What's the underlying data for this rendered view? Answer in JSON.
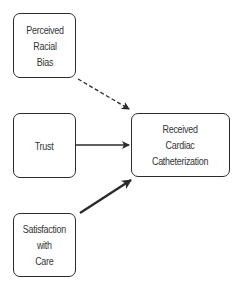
{
  "diagram": {
    "type": "path-diagram",
    "nodes": [
      {
        "id": "perceived_racial_bias",
        "label": "Perceived\nRacial\nBias"
      },
      {
        "id": "trust",
        "label": "Trust"
      },
      {
        "id": "satisfaction_with_care",
        "label": "Satisfaction\nwith\nCare"
      },
      {
        "id": "received_cardiac_catheterization",
        "label": "Received\nCardiac\nCatheterization"
      }
    ],
    "edges": [
      {
        "from": "perceived_racial_bias",
        "to": "received_cardiac_catheterization",
        "style": "dashed"
      },
      {
        "from": "trust",
        "to": "received_cardiac_catheterization",
        "style": "solid"
      },
      {
        "from": "satisfaction_with_care",
        "to": "received_cardiac_catheterization",
        "style": "solid-bold"
      }
    ],
    "colors": {
      "stroke": "#2b2b2b",
      "text": "#333333",
      "background": "#ffffff"
    }
  }
}
